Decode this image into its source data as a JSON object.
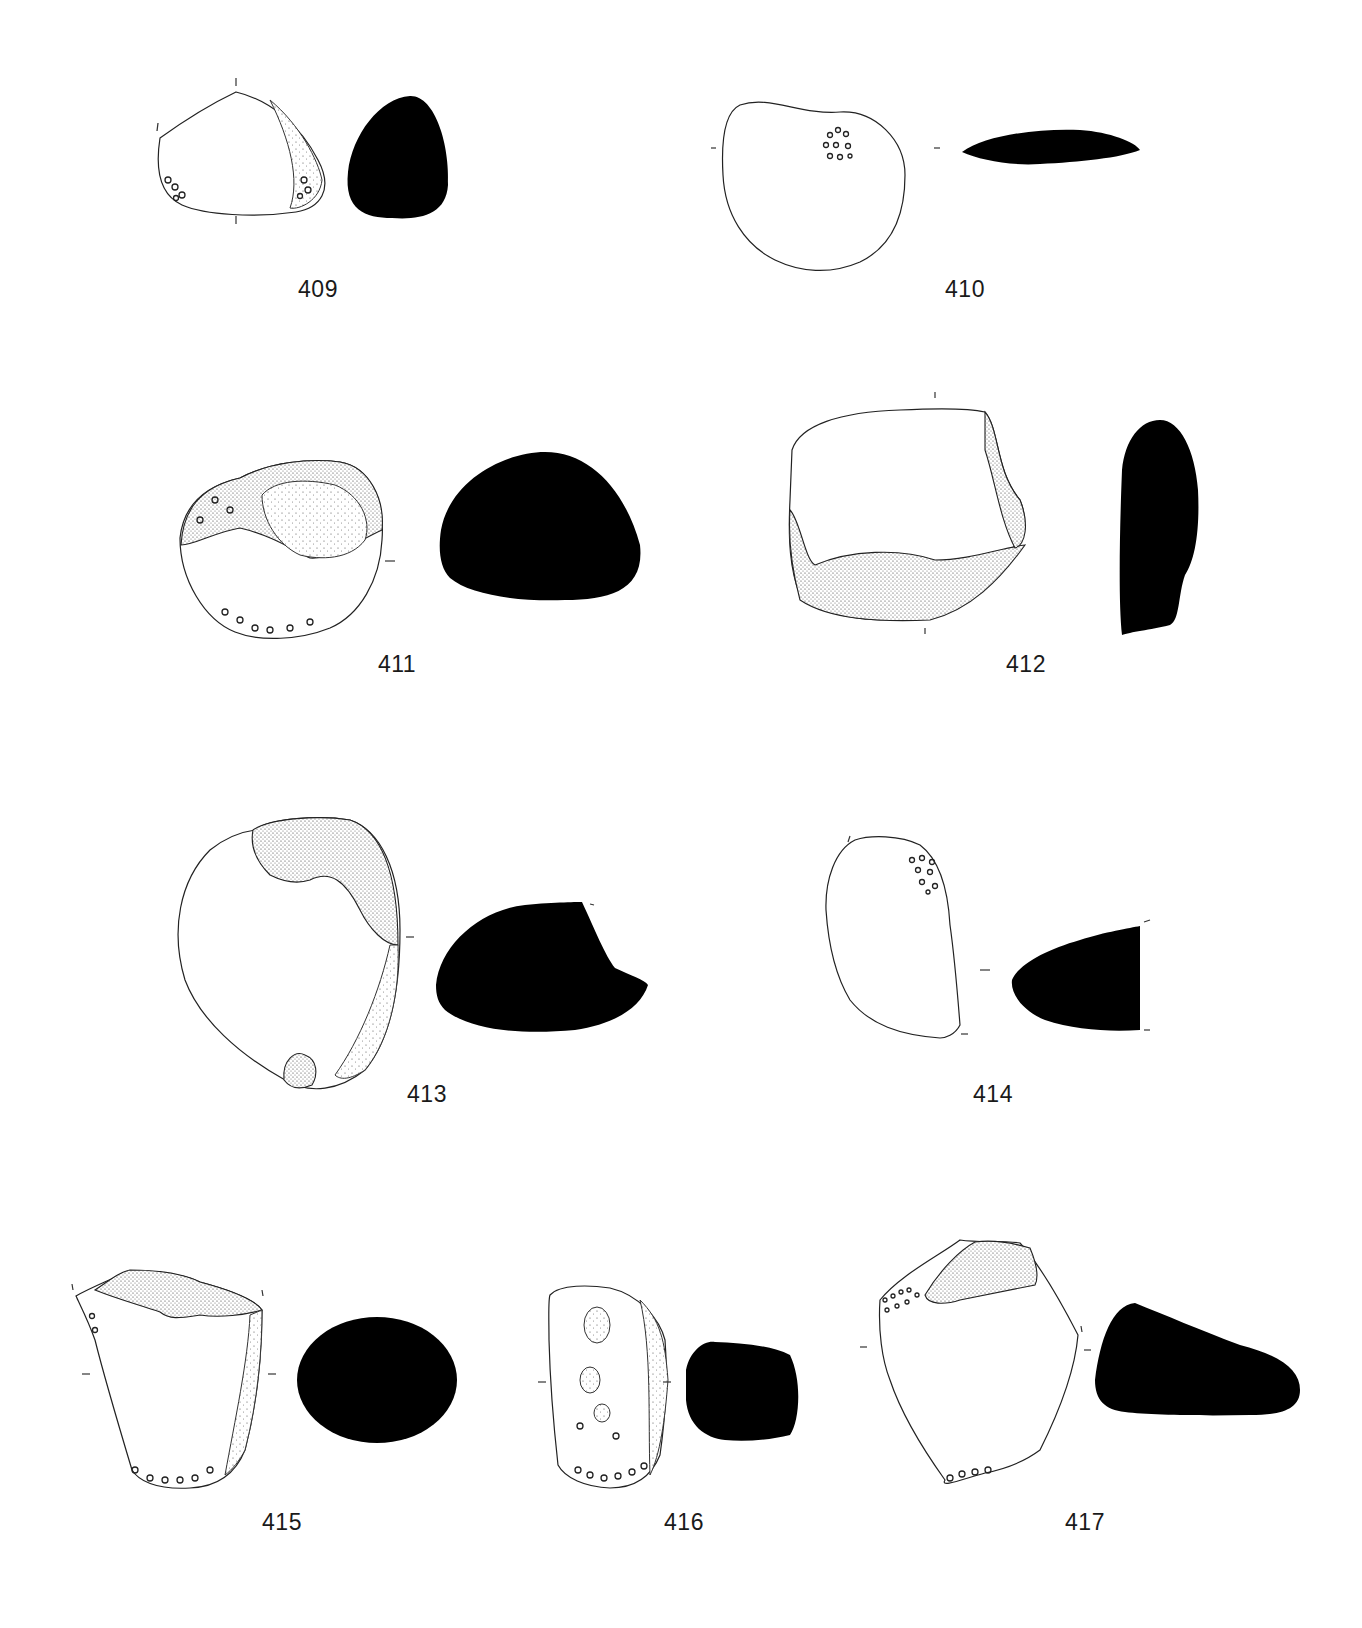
{
  "page": {
    "type": "archaeological figure plate",
    "background": "#ffffff",
    "section_fill": "#000000"
  },
  "artifacts": [
    {
      "id": "409",
      "label": "409",
      "view": "plan drawing with pecking marks at both ends",
      "section": "rounded triangular cross-section"
    },
    {
      "id": "410",
      "label": "410",
      "view": "rounded pebble with central pecked cluster",
      "section": "thin lenticular cross-section"
    },
    {
      "id": "411",
      "label": "411",
      "view": "pebble with pitted cortex on upper half and pecking along base",
      "section": "dome-shaped cross-section"
    },
    {
      "id": "412",
      "label": "412",
      "view": "rectangular fragment with flaked lower edge",
      "section": "elongated tall cross-section"
    },
    {
      "id": "413",
      "label": "413",
      "view": "oval pebble with flake scar at top right and small scar at base",
      "section": "truncated oval cross-section"
    },
    {
      "id": "414",
      "label": "414",
      "view": "kidney-shaped pebble with pecking cluster at top right",
      "section": "wedge-shaped cross-section"
    },
    {
      "id": "415",
      "label": "415",
      "view": "truncated conical fragment with fractured top and pecked base",
      "section": "oval cross-section"
    },
    {
      "id": "416",
      "label": "416",
      "view": "elongated pebble with pits on face and pecked base",
      "section": "sub-rectangular cross-section"
    },
    {
      "id": "417",
      "label": "417",
      "view": "polygonal fragment with flake scars at top and pecked base",
      "section": "wedge/trapezoidal cross-section"
    }
  ]
}
